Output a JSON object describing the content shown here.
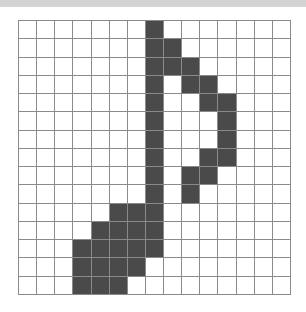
{
  "page": {
    "background_color": "#ffffff",
    "top_band_color": "#d4d4d4"
  },
  "grid": {
    "name": "pixel-art-grid",
    "columns": 15,
    "rows": 15,
    "cell_size_px": 18,
    "line_color": "#8a8a8a",
    "empty_color": "#ffffff",
    "filled_color": "#4a4a4a",
    "subject": "eighth-note",
    "filled_cells_by_row": [
      [
        7
      ],
      [
        7,
        8
      ],
      [
        7,
        8,
        9
      ],
      [
        7,
        9,
        10
      ],
      [
        7,
        10,
        11
      ],
      [
        7,
        11
      ],
      [
        7,
        11
      ],
      [
        7,
        10,
        11
      ],
      [
        7,
        9,
        10
      ],
      [
        7,
        9
      ],
      [
        5,
        6,
        7
      ],
      [
        4,
        5,
        6,
        7
      ],
      [
        3,
        4,
        5,
        6,
        7
      ],
      [
        3,
        4,
        5,
        6
      ],
      [
        3,
        4,
        5
      ]
    ]
  }
}
